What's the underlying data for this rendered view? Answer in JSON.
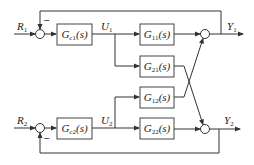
{
  "diagram": {
    "type": "block-diagram",
    "inputs": [
      {
        "main": "R",
        "sub": "1"
      },
      {
        "main": "R",
        "sub": "2"
      }
    ],
    "controllers": [
      {
        "main": "G",
        "sub": "c1",
        "arg": "(s)"
      },
      {
        "main": "G",
        "sub": "c2",
        "arg": "(s)"
      }
    ],
    "controls": [
      {
        "main": "U",
        "sub": "1"
      },
      {
        "main": "U",
        "sub": "2"
      }
    ],
    "plants": [
      {
        "main": "G",
        "sub": "11",
        "arg": "(s)"
      },
      {
        "main": "G",
        "sub": "21",
        "arg": "(s)"
      },
      {
        "main": "G",
        "sub": "12",
        "arg": "(s)"
      },
      {
        "main": "G",
        "sub": "22",
        "arg": "(s)"
      }
    ],
    "outputs": [
      {
        "main": "Y",
        "sub": "1"
      },
      {
        "main": "Y",
        "sub": "2"
      }
    ],
    "feedback_sign": "−",
    "colors": {
      "line": "#333333",
      "box_border": "#444444",
      "background": "#ffffff"
    }
  }
}
